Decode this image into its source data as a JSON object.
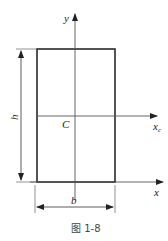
{
  "figure": {
    "caption": "图 1-8"
  },
  "labels": {
    "y_axis": "y",
    "x_axis": "x",
    "xc_axis": "x",
    "xc_subscript": "c",
    "centroid": "C",
    "height": "h",
    "width": "b"
  },
  "colors": {
    "stroke": "#2a2a2a",
    "axis": "#555555",
    "background": "#ffffff"
  }
}
